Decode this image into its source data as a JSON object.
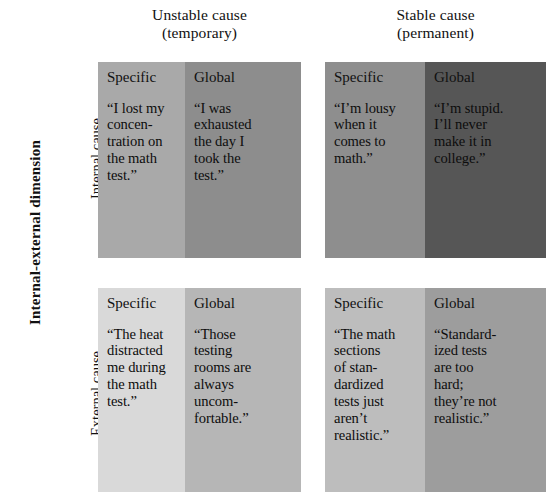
{
  "figure": {
    "vertical_dimension_label": "Internal-external dimension",
    "columns": [
      {
        "id": "unstable",
        "line1": "Unstable cause",
        "line2": "(temporary)"
      },
      {
        "id": "stable",
        "line1": "Stable cause",
        "line2": "(permanent)"
      }
    ],
    "rows": [
      {
        "id": "internal",
        "label": "Internal cause"
      },
      {
        "id": "external",
        "label": "External cause"
      }
    ],
    "subcolumn_labels": {
      "specific": "Specific",
      "global": "Global"
    },
    "colors": {
      "internal_unstable_specific": "#a9a9a9",
      "internal_unstable_global": "#8d8d8d",
      "internal_stable_specific": "#8e8e8e",
      "internal_stable_global": "#565656",
      "external_unstable_specific": "#d9d9d9",
      "external_unstable_global": "#b6b6b6",
      "external_stable_specific": "#bdbdbd",
      "external_stable_global": "#9d9d9d",
      "background": "#ffffff",
      "text": "#111111"
    },
    "cells": {
      "internal_unstable": {
        "specific_title": "Specific",
        "specific_quote": "“I lost my\nconcen-\ntration on\nthe math\ntest.”",
        "global_title": "Global",
        "global_quote": "“I was\nexhausted\nthe day I\ntook the\ntest.”"
      },
      "internal_stable": {
        "specific_title": "Specific",
        "specific_quote": "“I’m lousy\nwhen it\ncomes to\nmath.”",
        "global_title": "Global",
        "global_quote": "“I’m stupid.\nI’ll never\nmake it in\ncollege.”"
      },
      "external_unstable": {
        "specific_title": "Specific",
        "specific_quote": "“The heat\ndistracted\nme during\nthe math\ntest.”",
        "global_title": "Global",
        "global_quote": "“Those\ntesting\nrooms are\nalways\nuncom-\nfortable.”"
      },
      "external_stable": {
        "specific_title": "Specific",
        "specific_quote": "“The math\nsections\nof stan-\ndardized\ntests just\naren’t\nrealistic.”",
        "global_title": "Global",
        "global_quote": "“Standard-\nized tests\nare too\nhard;\nthey’re not\nrealistic.”"
      }
    }
  }
}
